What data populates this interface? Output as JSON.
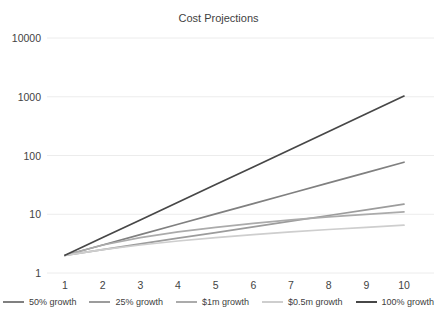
{
  "chart_data": {
    "type": "line",
    "title": "Cost Projections",
    "xlabel": "",
    "ylabel": "",
    "x": [
      1,
      2,
      3,
      4,
      5,
      6,
      7,
      8,
      9,
      10
    ],
    "y_scale": "log",
    "y_ticks": [
      "1",
      "10",
      "100",
      "1000",
      "10000"
    ],
    "y_tick_values": [
      1,
      10,
      100,
      1000,
      10000
    ],
    "ylim": [
      1,
      10000
    ],
    "grid": "horizontal",
    "legend_position": "bottom",
    "series": [
      {
        "name": "50% growth",
        "color": "#808080",
        "values": [
          2,
          3,
          4.5,
          6.75,
          10.13,
          15.19,
          22.78,
          34.17,
          51.26,
          76.89
        ]
      },
      {
        "name": "25% growth",
        "color": "#9c9c9c",
        "values": [
          2,
          2.5,
          3.13,
          3.91,
          4.88,
          6.1,
          7.63,
          9.54,
          11.92,
          14.9
        ]
      },
      {
        "name": "$1m growth",
        "color": "#ababab",
        "values": [
          2,
          3,
          4,
          5,
          6,
          7,
          8,
          9,
          10,
          11
        ]
      },
      {
        "name": "$0.5m growth",
        "color": "#cecece",
        "values": [
          2,
          2.5,
          3,
          3.5,
          4,
          4.5,
          5,
          5.5,
          6,
          6.5
        ]
      },
      {
        "name": "100% growth",
        "color": "#474747",
        "values": [
          2,
          4,
          8,
          16,
          32,
          64,
          128,
          256,
          512,
          1024
        ]
      }
    ],
    "gridline_color": "#ececec",
    "text_color": "#434343"
  }
}
